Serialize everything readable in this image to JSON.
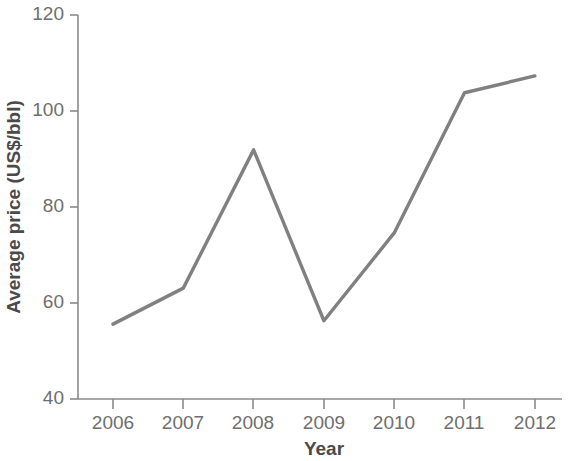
{
  "chart_data": {
    "type": "line",
    "title": "",
    "subtitle": "",
    "xlabel": "Year",
    "ylabel": "Average price (US$/bbl)",
    "x": [
      2006,
      2007,
      2008,
      2009,
      2010,
      2011,
      2012
    ],
    "categories": [
      "2006",
      "2007",
      "2008",
      "2009",
      "2010",
      "2011",
      "2012"
    ],
    "values": [
      55.6,
      63.1,
      91.9,
      56.3,
      74.6,
      103.8,
      107.3
    ],
    "series": [
      {
        "name": "Average price",
        "values": [
          55.6,
          63.1,
          91.9,
          56.3,
          74.6,
          103.8,
          107.3
        ]
      }
    ],
    "xlim": [
      2005.5,
      2012.7
    ],
    "ylim": [
      40,
      120
    ],
    "yticks": [
      40,
      60,
      80,
      100,
      120
    ],
    "ytick_labels": [
      "40",
      "60",
      "80",
      "100",
      "120"
    ],
    "xticks": [
      2006,
      2007,
      2008,
      2009,
      2010,
      2011,
      2012
    ],
    "xtick_labels": [
      "2006",
      "2007",
      "2008",
      "2009",
      "2010",
      "2011",
      "2012"
    ],
    "grid": false,
    "legend": false,
    "legend_position": "none",
    "line_color": "#808080",
    "axis_color": "#8a8a8a",
    "tick_label_color": "#6e6e6e",
    "axis_title_color": "#4a4a4a",
    "background_color": "#ffffff",
    "annotations": []
  },
  "axis": {
    "y_title": "Average price (US$/bbl)",
    "x_title": "Year",
    "y_tick_0": "40",
    "y_tick_1": "60",
    "y_tick_2": "80",
    "y_tick_3": "100",
    "y_tick_4": "120",
    "x_tick_0": "2006",
    "x_tick_1": "2007",
    "x_tick_2": "2008",
    "x_tick_3": "2009",
    "x_tick_4": "2010",
    "x_tick_5": "2011",
    "x_tick_6": "2012"
  }
}
